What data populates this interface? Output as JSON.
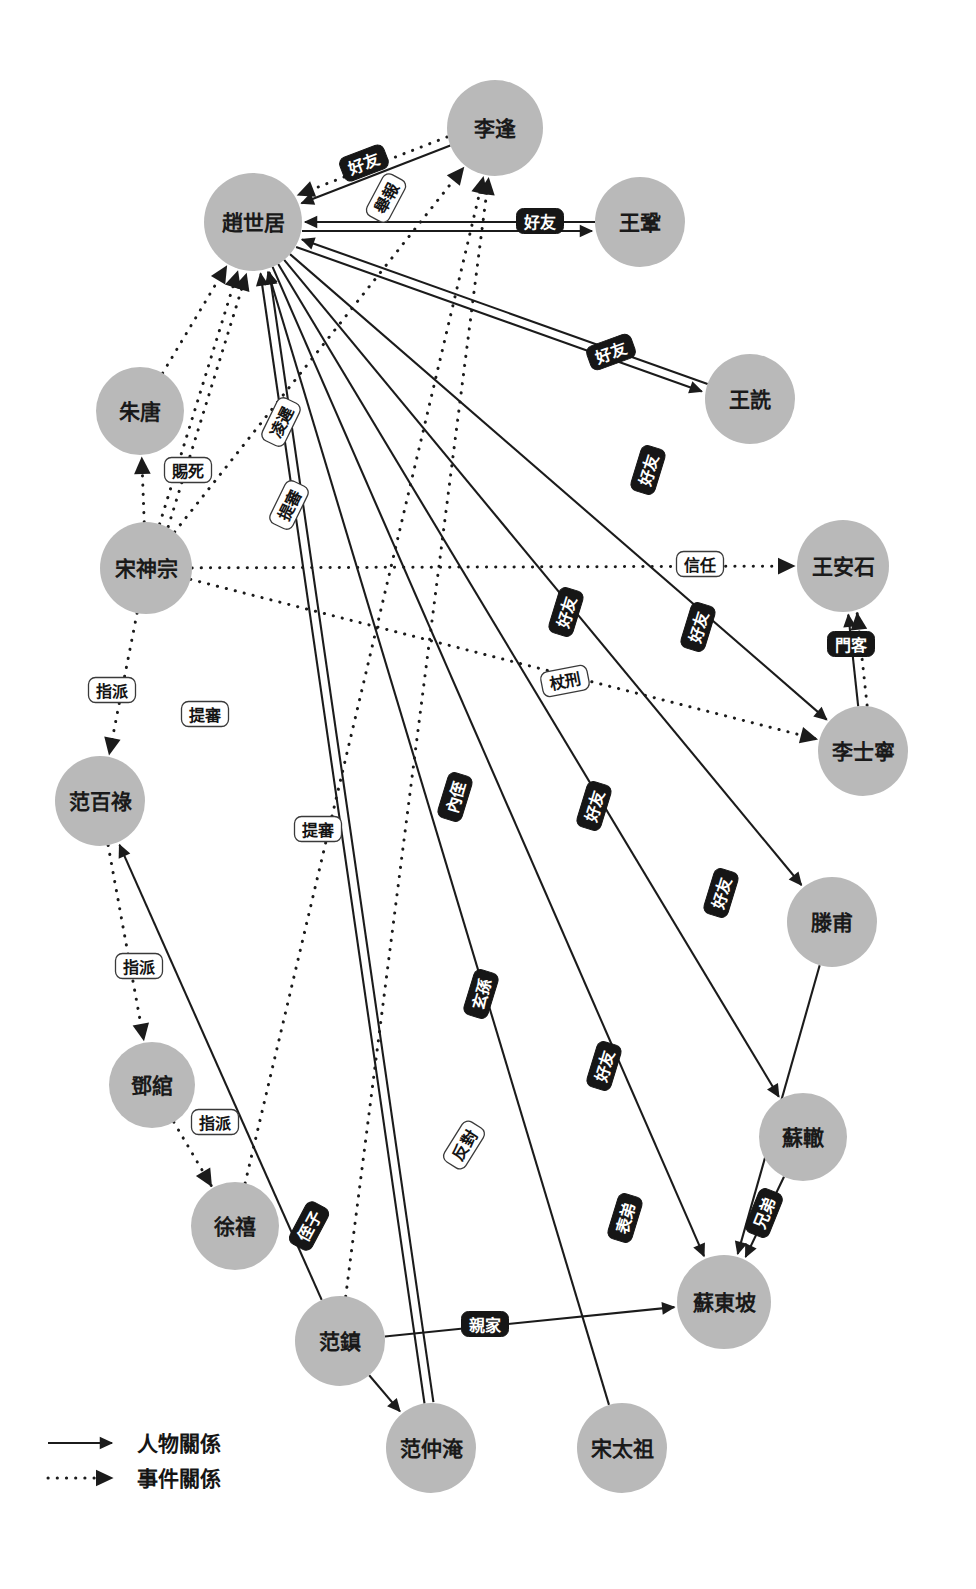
{
  "diagram": {
    "colors": {
      "node_fill": "#b9b9b9",
      "edge": "#1b1b1b",
      "label_dark_bg": "#161616",
      "label_dark_text": "#ffffff",
      "label_light_bg": "#ffffff",
      "label_light_text": "#141414",
      "background": "#ffffff"
    },
    "nodes": [
      {
        "id": "lifeng",
        "label": "李逢",
        "cx": 495,
        "cy": 128,
        "r": 48
      },
      {
        "id": "zhaoshiju",
        "label": "趙世居",
        "cx": 253,
        "cy": 222,
        "r": 49
      },
      {
        "id": "wanggong",
        "label": "王鞏",
        "cx": 640,
        "cy": 222,
        "r": 45
      },
      {
        "id": "zhutang",
        "label": "朱唐",
        "cx": 140,
        "cy": 411,
        "r": 44
      },
      {
        "id": "wangshen",
        "label": "王詵",
        "cx": 750,
        "cy": 399,
        "r": 45
      },
      {
        "id": "songshenzong",
        "label": "宋神宗",
        "cx": 146,
        "cy": 568,
        "r": 46
      },
      {
        "id": "wanganshi",
        "label": "王安石",
        "cx": 843,
        "cy": 566,
        "r": 46
      },
      {
        "id": "lishining",
        "label": "李士寧",
        "cx": 863,
        "cy": 751,
        "r": 45
      },
      {
        "id": "fanbailu",
        "label": "范百祿",
        "cx": 100,
        "cy": 801,
        "r": 45
      },
      {
        "id": "tengfu",
        "label": "滕甫",
        "cx": 832,
        "cy": 922,
        "r": 45
      },
      {
        "id": "dengguan",
        "label": "鄧綰",
        "cx": 152,
        "cy": 1085,
        "r": 43
      },
      {
        "id": "suzhe",
        "label": "蘇轍",
        "cx": 803,
        "cy": 1137,
        "r": 44
      },
      {
        "id": "xuxi",
        "label": "徐禧",
        "cx": 235,
        "cy": 1226,
        "r": 44
      },
      {
        "id": "fanzhen",
        "label": "范鎮",
        "cx": 340,
        "cy": 1341,
        "r": 45
      },
      {
        "id": "sudongpo",
        "label": "蘇東坡",
        "cx": 724,
        "cy": 1302,
        "r": 47
      },
      {
        "id": "fanzhongyan",
        "label": "范仲淹",
        "cx": 431,
        "cy": 1448,
        "r": 45
      },
      {
        "id": "songtaizu",
        "label": "宋太祖",
        "cx": 622,
        "cy": 1448,
        "r": 45
      }
    ],
    "edges": [
      {
        "from": "lifeng",
        "to": "zhaoshiju",
        "type": "person",
        "label": "好友",
        "lx": 364,
        "ly": 163,
        "rot": -21,
        "style": "dark"
      },
      {
        "from": "lifeng",
        "to": "zhaoshiju",
        "type": "event",
        "label": "舉報",
        "lx": 386,
        "ly": 198,
        "rot": -62,
        "style": "light"
      },
      {
        "from": "wanggong",
        "to": "zhaoshiju",
        "type": "person",
        "label": "好友",
        "lx": 540,
        "ly": 221,
        "rot": 0,
        "style": "dark"
      },
      {
        "from": "wangshen",
        "to": "zhaoshiju",
        "type": "person",
        "label": "好友",
        "lx": 611,
        "ly": 352,
        "rot": -20,
        "style": "dark"
      },
      {
        "from": "zhutang",
        "to": "zhaoshiju",
        "type": "event",
        "label": "",
        "lx": 0,
        "ly": 0,
        "rot": 0,
        "style": "light"
      },
      {
        "from": "songshenzong",
        "to": "zhutang",
        "type": "event",
        "label": "賜死",
        "lx": 188,
        "ly": 470,
        "rot": 0,
        "style": "light"
      },
      {
        "from": "songshenzong",
        "to": "zhaoshiju",
        "type": "event",
        "label": "凌遲",
        "lx": 281,
        "ly": 422,
        "rot": -64,
        "style": "light"
      },
      {
        "from": "songshenzong",
        "to": "zhaoshiju",
        "type": "event",
        "label": "提審",
        "lx": 289,
        "ly": 505,
        "rot": -64,
        "style": "light"
      },
      {
        "from": "songshenzong",
        "to": "wanganshi",
        "type": "event",
        "label": "信任",
        "lx": 700,
        "ly": 564,
        "rot": 0,
        "style": "light"
      },
      {
        "from": "songshenzong",
        "to": "fanbailu",
        "type": "event",
        "label": "指派",
        "lx": 112,
        "ly": 690,
        "rot": 0,
        "style": "light"
      },
      {
        "from": "songshenzong",
        "to": "lifeng",
        "type": "event",
        "label": "提審",
        "lx": 205,
        "ly": 714,
        "rot": 0,
        "style": "light"
      },
      {
        "from": "songshenzong",
        "to": "lishining",
        "type": "event",
        "label": "杖刑",
        "lx": 565,
        "ly": 681,
        "rot": -11,
        "style": "light"
      },
      {
        "from": "fanbailu",
        "to": "dengguan",
        "type": "event",
        "label": "指派",
        "lx": 139,
        "ly": 966,
        "rot": 0,
        "style": "light"
      },
      {
        "from": "dengguan",
        "to": "xuxi",
        "type": "event",
        "label": "指派",
        "lx": 215,
        "ly": 1122,
        "rot": 0,
        "style": "light"
      },
      {
        "from": "xuxi",
        "to": "lifeng",
        "type": "event",
        "label": "提審",
        "lx": 318,
        "ly": 829,
        "rot": 0,
        "style": "light"
      },
      {
        "from": "lishining",
        "to": "wanganshi",
        "type": "person",
        "label": "門客",
        "lx": 851,
        "ly": 644,
        "rot": 0,
        "style": "dark"
      },
      {
        "from": "lishining",
        "to": "wanganshi",
        "type": "event",
        "label": "",
        "lx": 0,
        "ly": 0,
        "rot": 0,
        "style": "light"
      },
      {
        "from": "zhaoshiju",
        "to": "lishining",
        "type": "person",
        "label": "好友",
        "lx": 698,
        "ly": 627,
        "rot": -73,
        "style": "dark"
      },
      {
        "from": "zhaoshiju",
        "to": "wangshen",
        "type": "person",
        "label": "好友",
        "lx": 648,
        "ly": 470,
        "rot": -73,
        "style": "dark"
      },
      {
        "from": "zhaoshiju",
        "to": "wanggong",
        "type": "person",
        "label": "好友",
        "lx": 566,
        "ly": 612,
        "rot": -73,
        "style": "dark"
      },
      {
        "from": "zhaoshiju",
        "to": "sudongpo",
        "type": "person",
        "label": "好友",
        "lx": 721,
        "ly": 893,
        "rot": -73,
        "style": "dark"
      },
      {
        "from": "zhaoshiju",
        "to": "tengfu",
        "type": "person",
        "label": "好友",
        "lx": 594,
        "ly": 806,
        "rot": -73,
        "style": "dark"
      },
      {
        "from": "zhaoshiju",
        "to": "suzhe",
        "type": "person",
        "label": "好友",
        "lx": 604,
        "ly": 1066,
        "rot": -73,
        "style": "dark"
      },
      {
        "from": "fanzhongyan",
        "to": "zhaoshiju",
        "type": "person",
        "label": "內侄",
        "lx": 455,
        "ly": 797,
        "rot": -73,
        "style": "dark"
      },
      {
        "from": "fanzhongyan",
        "to": "zhaoshiju",
        "type": "person",
        "label": "玄孫",
        "lx": 481,
        "ly": 994,
        "rot": -73,
        "style": "dark"
      },
      {
        "from": "songtaizu",
        "to": "zhaoshiju",
        "type": "person",
        "label": "表弟",
        "lx": 625,
        "ly": 1218,
        "rot": -73,
        "style": "dark"
      },
      {
        "from": "tengfu",
        "to": "sudongpo",
        "type": "person",
        "label": "",
        "lx": 0,
        "ly": 0,
        "rot": 0,
        "style": "dark"
      },
      {
        "from": "suzhe",
        "to": "sudongpo",
        "type": "person",
        "label": "兄弟",
        "lx": 764,
        "ly": 1213,
        "rot": -68,
        "style": "dark"
      },
      {
        "from": "fanzhen",
        "to": "sudongpo",
        "type": "person",
        "label": "親家",
        "lx": 485,
        "ly": 1324,
        "rot": 0,
        "style": "dark"
      },
      {
        "from": "fanzhen",
        "to": "fanbailu",
        "type": "person",
        "label": "侄子",
        "lx": 309,
        "ly": 1226,
        "rot": -62,
        "style": "dark"
      },
      {
        "from": "fanzhen",
        "to": "lifeng",
        "type": "event",
        "label": "反對",
        "lx": 464,
        "ly": 1145,
        "rot": -58,
        "style": "light"
      },
      {
        "from": "fanzhen",
        "to": "fanzhongyan",
        "type": "person",
        "label": "",
        "lx": 0,
        "ly": 0,
        "rot": 0,
        "style": "dark"
      }
    ],
    "legend": {
      "items": [
        {
          "label": "人物關係",
          "type": "person"
        },
        {
          "label": "事件關係",
          "type": "event"
        }
      ]
    }
  }
}
